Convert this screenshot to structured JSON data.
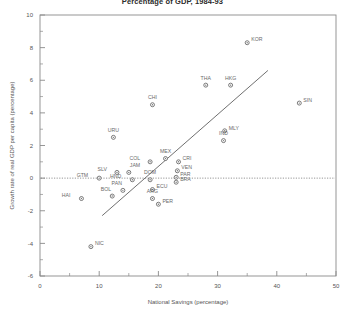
{
  "chart_data": {
    "type": "scatter",
    "title": "Percentage of GDP, 1984-93",
    "xlabel": "National Savings (percentage)",
    "ylabel": "Growth rate of real GDP per capita (percentage)",
    "xlim": [
      0,
      50
    ],
    "ylim": [
      -6,
      10
    ],
    "xticks": [
      0,
      10,
      20,
      30,
      40,
      50
    ],
    "xticks_minor": [
      5,
      15,
      25,
      35,
      45
    ],
    "yticks": [
      -6,
      -4,
      -2,
      0,
      2,
      4,
      6,
      8,
      10
    ],
    "yticks_minor": [
      -5,
      -3,
      -1,
      1,
      3,
      5,
      7,
      9
    ],
    "grid": false,
    "legend": "none",
    "zero_line": {
      "y": 0,
      "style": "dotted"
    },
    "trend_line": {
      "x0": 10.5,
      "y0": -2.3,
      "x1": 38.5,
      "y1": 6.6
    },
    "points": [
      {
        "label": "KOR",
        "x": 35.0,
        "y": 8.3,
        "lx": 4,
        "ly": 1.5
      },
      {
        "label": "THA",
        "x": 28.0,
        "y": 5.7,
        "lx": 0,
        "ly": 9
      },
      {
        "label": "HKG",
        "x": 32.2,
        "y": 5.7,
        "lx": 0,
        "ly": 9
      },
      {
        "label": "SIN",
        "x": 43.8,
        "y": 4.6,
        "lx": 4,
        "ly": 1.5
      },
      {
        "label": "CHI",
        "x": 19.0,
        "y": 4.5,
        "lx": 0,
        "ly": 9
      },
      {
        "label": "MLY",
        "x": 31.2,
        "y": 2.9,
        "lx": 4,
        "ly": 1.0
      },
      {
        "label": "IND",
        "x": 31.0,
        "y": 2.3,
        "lx": 0,
        "ly": 9
      },
      {
        "label": "URU",
        "x": 12.4,
        "y": 2.5,
        "lx": 0,
        "ly": 9
      },
      {
        "label": "MEX",
        "x": 21.2,
        "y": 1.2,
        "lx": 0,
        "ly": 9
      },
      {
        "label": "COL",
        "x": 18.6,
        "y": 1.0,
        "lx": -10,
        "ly": 1.5
      },
      {
        "label": "CRI",
        "x": 23.4,
        "y": 1.0,
        "lx": 4,
        "ly": 1.5
      },
      {
        "label": "VEN",
        "x": 23.2,
        "y": 0.45,
        "lx": 4,
        "ly": 1.5
      },
      {
        "label": "PAR",
        "x": 23.0,
        "y": 0.05,
        "lx": 4,
        "ly": 1.0
      },
      {
        "label": "BRA",
        "x": 23.0,
        "y": -0.25,
        "lx": 4,
        "ly": 1.0
      },
      {
        "label": "SLV",
        "x": 13.0,
        "y": 0.35,
        "lx": -10,
        "ly": 1.5
      },
      {
        "label": "JAM",
        "x": 15.0,
        "y": 0.35,
        "lx": 1,
        "ly": 9
      },
      {
        "label": "HND",
        "x": 15.6,
        "y": -0.1,
        "lx": -11,
        "ly": 2.0
      },
      {
        "label": "DOM",
        "x": 18.6,
        "y": -0.1,
        "lx": 0,
        "ly": 9
      },
      {
        "label": "GTM",
        "x": 10.0,
        "y": 0.0,
        "lx": -11,
        "ly": 1.5
      },
      {
        "label": "PAN",
        "x": 14.0,
        "y": -0.75,
        "lx": -1,
        "ly": 9
      },
      {
        "label": "ECU",
        "x": 19.0,
        "y": -0.7,
        "lx": 4,
        "ly": 1.5
      },
      {
        "label": "BOL",
        "x": 12.2,
        "y": -1.1,
        "lx": -1,
        "ly": 9
      },
      {
        "label": "ARG",
        "x": 19.0,
        "y": -1.25,
        "lx": 0,
        "ly": 9
      },
      {
        "label": "HAI",
        "x": 7.0,
        "y": -1.25,
        "lx": -11,
        "ly": 1.5
      },
      {
        "label": "PER",
        "x": 20.0,
        "y": -1.6,
        "lx": 4,
        "ly": 1.5
      },
      {
        "label": "NIC",
        "x": 8.6,
        "y": -4.2,
        "lx": 4,
        "ly": 1.5
      }
    ]
  }
}
